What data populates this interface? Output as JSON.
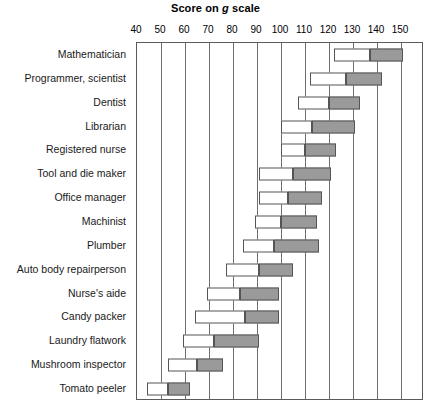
{
  "chart_data": {
    "type": "bar",
    "subtype": "range-bar",
    "title": "Score on g scale",
    "title_plain": "Score on g scale",
    "xlabel": "",
    "ylabel": "",
    "xlim": [
      40,
      150
    ],
    "xticks": [
      40,
      50,
      60,
      70,
      80,
      90,
      100,
      110,
      120,
      130,
      140,
      150
    ],
    "xticklabels": [
      "40",
      "50",
      "60",
      "70",
      "80",
      "90",
      "100",
      "110",
      "120",
      "130",
      "140",
      "150"
    ],
    "grid": true,
    "grid_axis": "x",
    "legend": null,
    "categories": [
      "Mathematician",
      "Programmer, scientist",
      "Dentist",
      "Librarian",
      "Registered nurse",
      "Tool and die maker",
      "Office manager",
      "Machinist",
      "Plumber",
      "Auto body repairperson",
      "Nurse's aide",
      "Candy packer",
      "Laundry flatwork",
      "Mushroom inspector",
      "Tomato peeler"
    ],
    "series": [
      {
        "name": "lower range (white)",
        "color": "#ffffff",
        "starts": [
          122,
          112,
          107,
          100,
          100,
          91,
          91,
          89,
          84,
          77,
          69,
          64,
          59,
          53,
          44
        ],
        "ends": [
          137,
          127,
          120,
          113,
          110,
          105,
          103,
          100,
          97,
          91,
          83,
          85,
          72,
          65,
          53
        ]
      },
      {
        "name": "upper range (gray)",
        "color": "#9a9a9a",
        "starts": [
          137,
          127,
          120,
          113,
          110,
          105,
          103,
          100,
          97,
          91,
          83,
          85,
          72,
          65,
          53
        ],
        "ends": [
          151,
          142,
          133,
          131,
          123,
          121,
          117,
          115,
          116,
          105,
          99,
          99,
          91,
          76,
          62
        ]
      }
    ],
    "bars": [
      {
        "category": "Mathematician",
        "low": 122,
        "mid": 137,
        "high": 151
      },
      {
        "category": "Programmer, scientist",
        "low": 112,
        "mid": 127,
        "high": 142
      },
      {
        "category": "Dentist",
        "low": 107,
        "mid": 120,
        "high": 133
      },
      {
        "category": "Librarian",
        "low": 100,
        "mid": 113,
        "high": 131
      },
      {
        "category": "Registered nurse",
        "low": 100,
        "mid": 110,
        "high": 123
      },
      {
        "category": "Tool and die maker",
        "low": 91,
        "mid": 105,
        "high": 121
      },
      {
        "category": "Office manager",
        "low": 91,
        "mid": 103,
        "high": 117
      },
      {
        "category": "Machinist",
        "low": 89,
        "mid": 100,
        "high": 115
      },
      {
        "category": "Plumber",
        "low": 84,
        "mid": 97,
        "high": 116
      },
      {
        "category": "Auto body repairperson",
        "low": 77,
        "mid": 91,
        "high": 105
      },
      {
        "category": "Nurse's aide",
        "low": 69,
        "mid": 83,
        "high": 99
      },
      {
        "category": "Candy packer",
        "low": 64,
        "mid": 85,
        "high": 99
      },
      {
        "category": "Laundry flatwork",
        "low": 59,
        "mid": 72,
        "high": 91
      },
      {
        "category": "Mushroom inspector",
        "low": 53,
        "mid": 65,
        "high": 76
      },
      {
        "category": "Tomato peeler",
        "low": 44,
        "mid": 53,
        "high": 62
      }
    ]
  },
  "colors": {
    "low_fill": "#ffffff",
    "high_fill": "#9a9a9a",
    "bar_stroke": "#555555",
    "gridline": "#6e6e6e",
    "frame": "#5a5a5a",
    "text": "#1a1a1a",
    "background": "#ffffff"
  }
}
